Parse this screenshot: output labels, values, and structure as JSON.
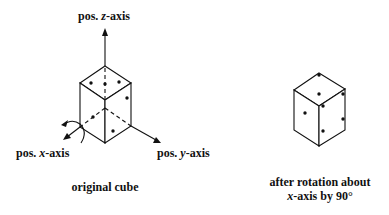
{
  "figure": {
    "left_panel": {
      "axis_labels": {
        "z": {
          "prefix": "pos. ",
          "axis": "z",
          "suffix": "-axis"
        },
        "x": {
          "prefix": "pos. ",
          "axis": "x",
          "suffix": "-axis"
        },
        "y": {
          "prefix": "pos. ",
          "axis": "y",
          "suffix": "-axis"
        }
      },
      "caption": "original cube"
    },
    "right_panel": {
      "caption_line1": "after rotation about",
      "caption_line2_axis": "x",
      "caption_line2_rest": "-axis by 90°"
    },
    "colors": {
      "line": "#111111",
      "background": "#ffffff"
    }
  }
}
